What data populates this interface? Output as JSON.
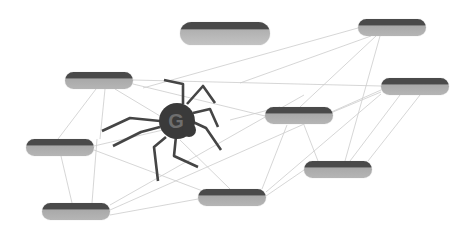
{
  "diagram": {
    "type": "network",
    "spider": {
      "cx": 177,
      "cy": 121,
      "r": 18,
      "mark": "G",
      "body_color": "#3a3a3a",
      "mark_color": "#6e6e6e"
    },
    "colors": {
      "edge": "#cccccc",
      "pill_top": "#4a4a4a",
      "pill_bottom": "#b3b3b3",
      "background": "#ffffff"
    },
    "nodes": [
      {
        "id": "A",
        "label": "",
        "x": 180,
        "y": 22,
        "w": 90,
        "h": 23,
        "big": true
      },
      {
        "id": "B",
        "label": "",
        "x": 65,
        "y": 72,
        "w": 68,
        "h": 17
      },
      {
        "id": "C",
        "label": "",
        "x": 358,
        "y": 19,
        "w": 68,
        "h": 17
      },
      {
        "id": "D",
        "label": "",
        "x": 381,
        "y": 78,
        "w": 68,
        "h": 17
      },
      {
        "id": "E",
        "label": "",
        "x": 265,
        "y": 107,
        "w": 68,
        "h": 17
      },
      {
        "id": "F",
        "label": "",
        "x": 26,
        "y": 139,
        "w": 68,
        "h": 17
      },
      {
        "id": "G",
        "label": "",
        "x": 304,
        "y": 161,
        "w": 68,
        "h": 17
      },
      {
        "id": "H",
        "label": "",
        "x": 198,
        "y": 189,
        "w": 68,
        "h": 17
      },
      {
        "id": "I",
        "label": "",
        "x": 42,
        "y": 203,
        "w": 68,
        "h": 17
      }
    ],
    "edges": [
      [
        133,
        80,
        381,
        86
      ],
      [
        133,
        84,
        265,
        116
      ],
      [
        96,
        89,
        58,
        139
      ],
      [
        105,
        89,
        100,
        139
      ],
      [
        115,
        89,
        175,
        125
      ],
      [
        61,
        156,
        72,
        203
      ],
      [
        97,
        139,
        92,
        203
      ],
      [
        94,
        150,
        216,
        196
      ],
      [
        94,
        146,
        163,
        130
      ],
      [
        110,
        205,
        304,
        95
      ],
      [
        110,
        210,
        381,
        90
      ],
      [
        110,
        215,
        198,
        199
      ],
      [
        240,
        83,
        371,
        36
      ],
      [
        300,
        107,
        376,
        36
      ],
      [
        345,
        161,
        380,
        36
      ],
      [
        280,
        107,
        230,
        120
      ],
      [
        333,
        112,
        381,
        92
      ],
      [
        287,
        125,
        262,
        189
      ],
      [
        304,
        125,
        318,
        161
      ],
      [
        266,
        192,
        381,
        94
      ],
      [
        266,
        196,
        304,
        170
      ],
      [
        350,
        161,
        400,
        95
      ],
      [
        368,
        161,
        420,
        95
      ],
      [
        180,
        140,
        230,
        189
      ],
      [
        143,
        88,
        358,
        28
      ]
    ],
    "legs": [
      [
        [
          183,
          104
        ],
        [
          183,
          84
        ],
        [
          164,
          80
        ]
      ],
      [
        [
          187,
          104
        ],
        [
          203,
          86
        ],
        [
          215,
          103
        ]
      ],
      [
        [
          193,
          113
        ],
        [
          210,
          109
        ],
        [
          218,
          127
        ]
      ],
      [
        [
          193,
          122
        ],
        [
          206,
          128
        ],
        [
          221,
          150
        ]
      ],
      [
        [
          176,
          136
        ],
        [
          174,
          156
        ],
        [
          198,
          167
        ]
      ],
      [
        [
          166,
          137
        ],
        [
          154,
          147
        ],
        [
          158,
          181
        ]
      ],
      [
        [
          160,
          121
        ],
        [
          130,
          118
        ],
        [
          102,
          131
        ]
      ],
      [
        [
          160,
          127
        ],
        [
          141,
          132
        ],
        [
          113,
          146
        ]
      ]
    ]
  }
}
